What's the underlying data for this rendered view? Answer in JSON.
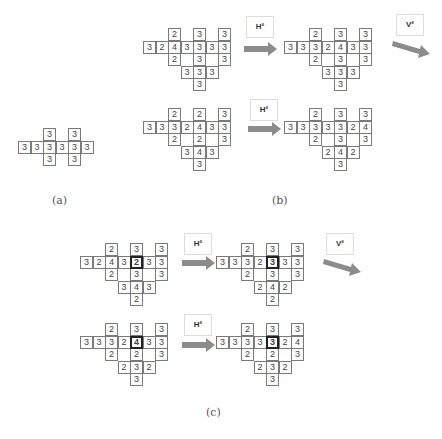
{
  "figure": {
    "panels": {
      "a": {
        "label": "(a)"
      },
      "b": {
        "label": "(b)"
      },
      "c": {
        "label": "(c)"
      }
    },
    "operators": {
      "h2": "H²",
      "v2": "V²"
    },
    "colors": {
      "cell_border": "#7a7a7a",
      "arrow": "#8c8c8c",
      "highlight_border": "#222222",
      "text": "#444444"
    }
  },
  "grids": {
    "a": {
      "cells": [
        {
          "r": 0,
          "c": 2,
          "v": "3"
        },
        {
          "r": 0,
          "c": 4,
          "v": "3"
        },
        {
          "r": 1,
          "c": 0,
          "v": "3"
        },
        {
          "r": 1,
          "c": 1,
          "v": "3"
        },
        {
          "r": 1,
          "c": 2,
          "v": "3"
        },
        {
          "r": 1,
          "c": 3,
          "v": "3"
        },
        {
          "r": 1,
          "c": 4,
          "v": "3"
        },
        {
          "r": 1,
          "c": 5,
          "v": "3"
        },
        {
          "r": 2,
          "c": 2,
          "v": "3"
        },
        {
          "r": 2,
          "c": 4,
          "v": "3"
        }
      ]
    },
    "b_top_left": {
      "cells": [
        {
          "r": 0,
          "c": 2,
          "v": "2"
        },
        {
          "r": 0,
          "c": 4,
          "v": "3"
        },
        {
          "r": 0,
          "c": 6,
          "v": "3"
        },
        {
          "r": 1,
          "c": 0,
          "v": "3"
        },
        {
          "r": 1,
          "c": 1,
          "v": "2"
        },
        {
          "r": 1,
          "c": 2,
          "v": "4"
        },
        {
          "r": 1,
          "c": 3,
          "v": "3"
        },
        {
          "r": 1,
          "c": 4,
          "v": "3"
        },
        {
          "r": 1,
          "c": 5,
          "v": "3"
        },
        {
          "r": 1,
          "c": 6,
          "v": "3"
        },
        {
          "r": 2,
          "c": 2,
          "v": "2"
        },
        {
          "r": 2,
          "c": 4,
          "v": "3"
        },
        {
          "r": 2,
          "c": 6,
          "v": "3"
        },
        {
          "r": 3,
          "c": 3,
          "v": "3"
        },
        {
          "r": 3,
          "c": 4,
          "v": "3"
        },
        {
          "r": 3,
          "c": 5,
          "v": "3"
        },
        {
          "r": 4,
          "c": 4,
          "v": "3"
        }
      ]
    },
    "b_top_right": {
      "cells": [
        {
          "r": 0,
          "c": 2,
          "v": "2"
        },
        {
          "r": 0,
          "c": 4,
          "v": "3"
        },
        {
          "r": 0,
          "c": 6,
          "v": "3"
        },
        {
          "r": 1,
          "c": 0,
          "v": "3"
        },
        {
          "r": 1,
          "c": 1,
          "v": "3"
        },
        {
          "r": 1,
          "c": 2,
          "v": "3"
        },
        {
          "r": 1,
          "c": 3,
          "v": "2"
        },
        {
          "r": 1,
          "c": 4,
          "v": "4"
        },
        {
          "r": 1,
          "c": 5,
          "v": "3"
        },
        {
          "r": 1,
          "c": 6,
          "v": "3"
        },
        {
          "r": 2,
          "c": 2,
          "v": "2"
        },
        {
          "r": 2,
          "c": 4,
          "v": "3"
        },
        {
          "r": 2,
          "c": 6,
          "v": "3"
        },
        {
          "r": 3,
          "c": 3,
          "v": "3"
        },
        {
          "r": 3,
          "c": 4,
          "v": "3"
        },
        {
          "r": 3,
          "c": 5,
          "v": "3"
        },
        {
          "r": 4,
          "c": 4,
          "v": "3"
        }
      ]
    },
    "b_bottom_left": {
      "cells": [
        {
          "r": 0,
          "c": 2,
          "v": "2"
        },
        {
          "r": 0,
          "c": 4,
          "v": "2"
        },
        {
          "r": 0,
          "c": 6,
          "v": "3"
        },
        {
          "r": 1,
          "c": 0,
          "v": "3"
        },
        {
          "r": 1,
          "c": 1,
          "v": "3"
        },
        {
          "r": 1,
          "c": 2,
          "v": "3"
        },
        {
          "r": 1,
          "c": 3,
          "v": "2"
        },
        {
          "r": 1,
          "c": 4,
          "v": "4"
        },
        {
          "r": 1,
          "c": 5,
          "v": "3"
        },
        {
          "r": 1,
          "c": 6,
          "v": "3"
        },
        {
          "r": 2,
          "c": 2,
          "v": "2"
        },
        {
          "r": 2,
          "c": 4,
          "v": "2"
        },
        {
          "r": 2,
          "c": 6,
          "v": "3"
        },
        {
          "r": 3,
          "c": 3,
          "v": "3"
        },
        {
          "r": 3,
          "c": 4,
          "v": "4"
        },
        {
          "r": 3,
          "c": 5,
          "v": "3"
        },
        {
          "r": 4,
          "c": 4,
          "v": "3"
        }
      ]
    },
    "b_bottom_right": {
      "cells": [
        {
          "r": 0,
          "c": 2,
          "v": "2"
        },
        {
          "r": 0,
          "c": 4,
          "v": "3"
        },
        {
          "r": 0,
          "c": 6,
          "v": "3"
        },
        {
          "r": 1,
          "c": 0,
          "v": "3"
        },
        {
          "r": 1,
          "c": 1,
          "v": "3"
        },
        {
          "r": 1,
          "c": 2,
          "v": "3"
        },
        {
          "r": 1,
          "c": 3,
          "v": "3"
        },
        {
          "r": 1,
          "c": 4,
          "v": "3"
        },
        {
          "r": 1,
          "c": 5,
          "v": "2"
        },
        {
          "r": 1,
          "c": 6,
          "v": "4"
        },
        {
          "r": 2,
          "c": 2,
          "v": "2"
        },
        {
          "r": 2,
          "c": 4,
          "v": "3"
        },
        {
          "r": 2,
          "c": 6,
          "v": "3"
        },
        {
          "r": 3,
          "c": 3,
          "v": "2"
        },
        {
          "r": 3,
          "c": 4,
          "v": "4"
        },
        {
          "r": 3,
          "c": 5,
          "v": "2"
        },
        {
          "r": 4,
          "c": 4,
          "v": "3"
        }
      ]
    },
    "c_top_left": {
      "cells": [
        {
          "r": 0,
          "c": 2,
          "v": "2"
        },
        {
          "r": 0,
          "c": 4,
          "v": "3"
        },
        {
          "r": 0,
          "c": 6,
          "v": "3"
        },
        {
          "r": 1,
          "c": 0,
          "v": "3"
        },
        {
          "r": 1,
          "c": 1,
          "v": "2"
        },
        {
          "r": 1,
          "c": 2,
          "v": "4"
        },
        {
          "r": 1,
          "c": 3,
          "v": "3"
        },
        {
          "r": 1,
          "c": 4,
          "v": "2",
          "hl": true
        },
        {
          "r": 1,
          "c": 5,
          "v": "3"
        },
        {
          "r": 1,
          "c": 6,
          "v": "3"
        },
        {
          "r": 2,
          "c": 2,
          "v": "2"
        },
        {
          "r": 2,
          "c": 4,
          "v": "3"
        },
        {
          "r": 2,
          "c": 6,
          "v": "3"
        },
        {
          "r": 3,
          "c": 3,
          "v": "3"
        },
        {
          "r": 3,
          "c": 4,
          "v": "4"
        },
        {
          "r": 3,
          "c": 5,
          "v": "3"
        },
        {
          "r": 4,
          "c": 4,
          "v": "2"
        }
      ]
    },
    "c_top_right": {
      "cells": [
        {
          "r": 0,
          "c": 2,
          "v": "2"
        },
        {
          "r": 0,
          "c": 4,
          "v": "3"
        },
        {
          "r": 0,
          "c": 6,
          "v": "3"
        },
        {
          "r": 1,
          "c": 0,
          "v": "3"
        },
        {
          "r": 1,
          "c": 1,
          "v": "3"
        },
        {
          "r": 1,
          "c": 2,
          "v": "3"
        },
        {
          "r": 1,
          "c": 3,
          "v": "2"
        },
        {
          "r": 1,
          "c": 4,
          "v": "3",
          "hl": true
        },
        {
          "r": 1,
          "c": 5,
          "v": "3"
        },
        {
          "r": 1,
          "c": 6,
          "v": "3"
        },
        {
          "r": 2,
          "c": 2,
          "v": "2"
        },
        {
          "r": 2,
          "c": 4,
          "v": "3"
        },
        {
          "r": 2,
          "c": 6,
          "v": "3"
        },
        {
          "r": 3,
          "c": 3,
          "v": "2"
        },
        {
          "r": 3,
          "c": 4,
          "v": "4"
        },
        {
          "r": 3,
          "c": 5,
          "v": "2"
        },
        {
          "r": 4,
          "c": 4,
          "v": "2"
        }
      ]
    },
    "c_bottom_left": {
      "cells": [
        {
          "r": 0,
          "c": 2,
          "v": "2"
        },
        {
          "r": 0,
          "c": 4,
          "v": "3"
        },
        {
          "r": 0,
          "c": 6,
          "v": "3"
        },
        {
          "r": 1,
          "c": 0,
          "v": "3"
        },
        {
          "r": 1,
          "c": 1,
          "v": "3"
        },
        {
          "r": 1,
          "c": 2,
          "v": "3"
        },
        {
          "r": 1,
          "c": 3,
          "v": "2"
        },
        {
          "r": 1,
          "c": 4,
          "v": "4",
          "hl": true
        },
        {
          "r": 1,
          "c": 5,
          "v": "3"
        },
        {
          "r": 1,
          "c": 6,
          "v": "3"
        },
        {
          "r": 2,
          "c": 2,
          "v": "2"
        },
        {
          "r": 2,
          "c": 4,
          "v": "2"
        },
        {
          "r": 2,
          "c": 6,
          "v": "3"
        },
        {
          "r": 3,
          "c": 3,
          "v": "2"
        },
        {
          "r": 3,
          "c": 4,
          "v": "3"
        },
        {
          "r": 3,
          "c": 5,
          "v": "2"
        },
        {
          "r": 4,
          "c": 4,
          "v": "3"
        }
      ]
    },
    "c_bottom_right": {
      "cells": [
        {
          "r": 0,
          "c": 2,
          "v": "2"
        },
        {
          "r": 0,
          "c": 4,
          "v": "3"
        },
        {
          "r": 0,
          "c": 6,
          "v": "3"
        },
        {
          "r": 1,
          "c": 0,
          "v": "3"
        },
        {
          "r": 1,
          "c": 1,
          "v": "3"
        },
        {
          "r": 1,
          "c": 2,
          "v": "3"
        },
        {
          "r": 1,
          "c": 3,
          "v": "3"
        },
        {
          "r": 1,
          "c": 4,
          "v": "3",
          "hl": true
        },
        {
          "r": 1,
          "c": 5,
          "v": "2"
        },
        {
          "r": 1,
          "c": 6,
          "v": "4"
        },
        {
          "r": 2,
          "c": 2,
          "v": "2"
        },
        {
          "r": 2,
          "c": 4,
          "v": "2"
        },
        {
          "r": 2,
          "c": 6,
          "v": "3"
        },
        {
          "r": 3,
          "c": 3,
          "v": "2"
        },
        {
          "r": 3,
          "c": 4,
          "v": "3"
        },
        {
          "r": 3,
          "c": 5,
          "v": "2"
        },
        {
          "r": 4,
          "c": 4,
          "v": "3"
        }
      ]
    }
  }
}
